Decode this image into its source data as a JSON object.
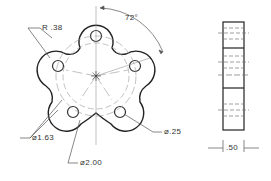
{
  "drawing": {
    "front_view": {
      "radius_label": "R .38",
      "angle_label": "72°",
      "bolt_circle_label": "⌀1.63",
      "outer_circle_label": "⌀2.00",
      "hole_label": "⌀.25"
    },
    "side_view": {
      "thickness_label": ".50"
    }
  }
}
